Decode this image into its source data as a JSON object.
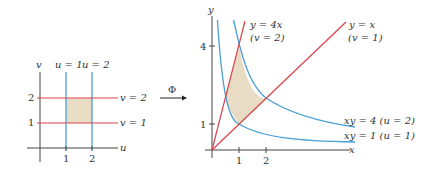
{
  "colors": {
    "u_curves": "#4a9fd4",
    "v_curves": "#d9434a",
    "region_fill": "#e8dcc4",
    "axis": "#444444",
    "text": "#333333"
  },
  "left_plot": {
    "x_axis_label": "u",
    "y_axis_label": "v",
    "x_ticks": [
      "1",
      "2"
    ],
    "y_ticks": [
      "1",
      "2"
    ],
    "vertical_lines": [
      {
        "label": "u = 1",
        "value": 1
      },
      {
        "label": "u = 2",
        "value": 2
      }
    ],
    "horizontal_lines": [
      {
        "label": "v = 2",
        "value": 2
      },
      {
        "label": "v = 1",
        "value": 1
      }
    ],
    "shaded_region": "1 ≤ u ≤ 2, 1 ≤ v ≤ 2"
  },
  "map_arrow": {
    "label": "Φ"
  },
  "right_plot": {
    "x_axis_label": "x",
    "y_axis_label": "y",
    "x_ticks": [
      "1",
      "2"
    ],
    "y_ticks": [
      "1",
      "4"
    ],
    "lines": [
      {
        "equation": "y = 4x",
        "param": "(v = 2)"
      },
      {
        "equation": "y = x",
        "param": "(v = 1)"
      }
    ],
    "hyperbolas": [
      {
        "equation": "xy = 4",
        "param": "(u = 2)",
        "text": "xy = 4 (u = 2)"
      },
      {
        "equation": "xy = 1",
        "param": "(u = 1)",
        "text": "xy = 1 (u = 1)"
      }
    ],
    "shaded_region": "1 ≤ xy ≤ 4, x ≤ y ≤ 4x"
  }
}
